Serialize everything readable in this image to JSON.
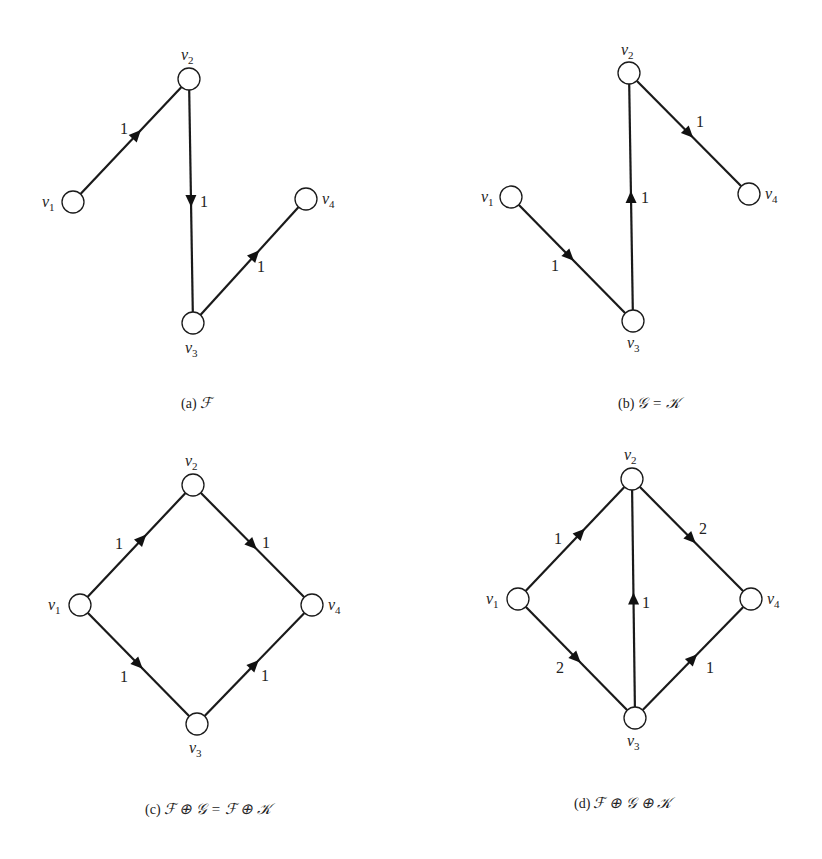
{
  "figure": {
    "node_radius": 11,
    "colors": {
      "stroke": "#1a1a1a",
      "node_fill": "#ffffff",
      "text": "#222222"
    },
    "panels": [
      {
        "id": "a",
        "caption": {
          "prefix": "(a)",
          "expr": "ℱ",
          "x": 181,
          "y": 408
        },
        "nodes": [
          {
            "id": "v1",
            "base": "v",
            "sub": "1",
            "x": 73,
            "y": 202,
            "lx": 42,
            "ly": 207
          },
          {
            "id": "v2",
            "base": "v",
            "sub": "2",
            "x": 189,
            "y": 79,
            "lx": 181,
            "ly": 60
          },
          {
            "id": "v3",
            "base": "v",
            "sub": "3",
            "x": 193,
            "y": 323,
            "lx": 185,
            "ly": 353
          },
          {
            "id": "v4",
            "base": "v",
            "sub": "4",
            "x": 306,
            "y": 199,
            "lx": 322,
            "ly": 204
          }
        ],
        "edges": [
          {
            "from": "v1",
            "to": "v2",
            "weight": "1",
            "t": 0.55,
            "lx": 120,
            "ly": 134
          },
          {
            "from": "v2",
            "to": "v3",
            "weight": "1",
            "t": 0.5,
            "lx": 200,
            "ly": 207
          },
          {
            "from": "v3",
            "to": "v4",
            "weight": "1",
            "t": 0.55,
            "lx": 257,
            "ly": 272
          }
        ]
      },
      {
        "id": "b",
        "caption": {
          "prefix": "(b)",
          "expr": "𝒢 = 𝒦",
          "x": 618,
          "y": 408
        },
        "nodes": [
          {
            "id": "v1",
            "base": "v",
            "sub": "1",
            "x": 511,
            "y": 197,
            "lx": 481,
            "ly": 202
          },
          {
            "id": "v2",
            "base": "v",
            "sub": "2",
            "x": 629,
            "y": 73,
            "lx": 621,
            "ly": 55
          },
          {
            "id": "v3",
            "base": "v",
            "sub": "3",
            "x": 633,
            "y": 321,
            "lx": 627,
            "ly": 348
          },
          {
            "id": "v4",
            "base": "v",
            "sub": "4",
            "x": 749,
            "y": 194,
            "lx": 765,
            "ly": 199
          }
        ],
        "edges": [
          {
            "from": "v1",
            "to": "v3",
            "weight": "1",
            "t": 0.48,
            "lx": 551,
            "ly": 271
          },
          {
            "from": "v3",
            "to": "v2",
            "weight": "1",
            "t": 0.5,
            "lx": 641,
            "ly": 203
          },
          {
            "from": "v2",
            "to": "v4",
            "weight": "1",
            "t": 0.5,
            "lx": 696,
            "ly": 127
          }
        ]
      },
      {
        "id": "c",
        "caption": {
          "prefix": "(c)",
          "expr": "ℱ ⊕ 𝒢 = ℱ ⊕ 𝒦",
          "x": 145,
          "y": 814
        },
        "nodes": [
          {
            "id": "v1",
            "base": "v",
            "sub": "1",
            "x": 80,
            "y": 605,
            "lx": 48,
            "ly": 610
          },
          {
            "id": "v2",
            "base": "v",
            "sub": "2",
            "x": 193,
            "y": 485,
            "lx": 185,
            "ly": 466
          },
          {
            "id": "v3",
            "base": "v",
            "sub": "3",
            "x": 197,
            "y": 724,
            "lx": 189,
            "ly": 753
          },
          {
            "id": "v4",
            "base": "v",
            "sub": "4",
            "x": 312,
            "y": 605,
            "lx": 328,
            "ly": 610
          }
        ],
        "edges": [
          {
            "from": "v1",
            "to": "v2",
            "weight": "1",
            "t": 0.55,
            "lx": 115,
            "ly": 549
          },
          {
            "from": "v2",
            "to": "v4",
            "weight": "1",
            "t": 0.5,
            "lx": 262,
            "ly": 548
          },
          {
            "from": "v1",
            "to": "v3",
            "weight": "1",
            "t": 0.5,
            "lx": 120,
            "ly": 682
          },
          {
            "from": "v3",
            "to": "v4",
            "weight": "1",
            "t": 0.5,
            "lx": 261,
            "ly": 681
          }
        ]
      },
      {
        "id": "d",
        "caption": {
          "prefix": "(d)",
          "expr": "ℱ ⊕ 𝒢 ⊕ 𝒦",
          "x": 574,
          "y": 808
        },
        "nodes": [
          {
            "id": "v1",
            "base": "v",
            "sub": "1",
            "x": 518,
            "y": 599,
            "lx": 486,
            "ly": 604
          },
          {
            "id": "v2",
            "base": "v",
            "sub": "2",
            "x": 632,
            "y": 479,
            "lx": 624,
            "ly": 460
          },
          {
            "id": "v3",
            "base": "v",
            "sub": "3",
            "x": 635,
            "y": 718,
            "lx": 627,
            "ly": 746
          },
          {
            "id": "v4",
            "base": "v",
            "sub": "4",
            "x": 751,
            "y": 599,
            "lx": 767,
            "ly": 604
          }
        ],
        "edges": [
          {
            "from": "v1",
            "to": "v2",
            "weight": "1",
            "t": 0.55,
            "lx": 554,
            "ly": 544
          },
          {
            "from": "v2",
            "to": "v4",
            "weight": "2",
            "t": 0.5,
            "lx": 699,
            "ly": 534
          },
          {
            "from": "v3",
            "to": "v2",
            "weight": "1",
            "t": 0.5,
            "lx": 642,
            "ly": 608
          },
          {
            "from": "v1",
            "to": "v3",
            "weight": "2",
            "t": 0.5,
            "lx": 556,
            "ly": 673
          },
          {
            "from": "v3",
            "to": "v4",
            "weight": "1",
            "t": 0.5,
            "lx": 706,
            "ly": 673
          }
        ]
      }
    ]
  }
}
